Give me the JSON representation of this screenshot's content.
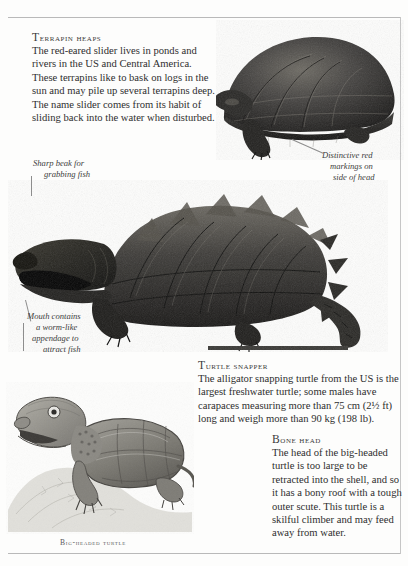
{
  "page": {
    "background_color": "#fdfdfc",
    "rule_color": "#b9b9b9",
    "text_color": "#2e2e2e"
  },
  "blocks": [
    {
      "id": "terrapin",
      "heading": "Terrapin heaps",
      "body": "The red-eared slider lives in ponds and rivers in the US and Central America. These terrapins like to bask on logs in the sun and may pile up several terrapins deep. The name slider comes from its habit of sliding back into the water when disturbed."
    },
    {
      "id": "snapper",
      "heading": "Turtle snapper",
      "body": "The alligator snapping turtle from the US is the largest freshwater turtle; some males have carapaces measuring more than 75 cm (2½ ft) long and weigh more than 90 kg (198 lb)."
    },
    {
      "id": "bonehead",
      "heading": "Bone head",
      "body": "The head of the big-headed turtle is too large to be retracted into the shell, and so it has a bony roof with a tough outer scute. This turtle is a skilful climber and may feed away from water."
    }
  ],
  "annotations": [
    {
      "id": "beak",
      "line1": "Sharp beak for",
      "line2": "grabbing fish"
    },
    {
      "id": "red-markings",
      "line1": "Distinctive red",
      "line2": "markings on",
      "line3": "side of head"
    },
    {
      "id": "mouth",
      "line1": "Mouth contains",
      "line2": "a worm-like",
      "line3": "appendage  to",
      "line4": "attract fish"
    }
  ],
  "captions": [
    {
      "id": "bigheaded",
      "text": "Big-headed turtle"
    }
  ],
  "figures": [
    {
      "id": "slider",
      "name": "red-eared-slider-photo",
      "subject": "Red-eared slider terrapin, side view"
    },
    {
      "id": "snapper",
      "name": "alligator-snapping-turtle-photo",
      "subject": "Alligator snapping turtle with spiked carapace and long tail"
    },
    {
      "id": "bigheaded",
      "name": "big-headed-turtle-illustration",
      "subject": "Big-headed turtle on a rock"
    }
  ]
}
